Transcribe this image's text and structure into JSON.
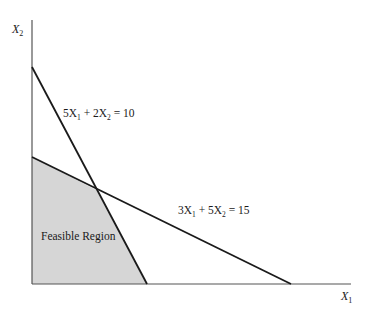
{
  "diagram": {
    "type": "linear-programming-feasible-region",
    "axes": {
      "x_label": "X",
      "x_sub": "1",
      "y_label": "X",
      "y_sub": "2"
    },
    "constraints": [
      {
        "id": "c1",
        "label_parts": {
          "a": "5X",
          "a_sub": "1",
          "op": " + 2X",
          "b_sub": "2",
          "rhs": " = 10"
        },
        "equation": "5X1 + 2X2 = 10",
        "x_intercept": 2,
        "y_intercept": 5
      },
      {
        "id": "c2",
        "label_parts": {
          "a": "3X",
          "a_sub": "1",
          "op": " + 5X",
          "b_sub": "2",
          "rhs": " = 15"
        },
        "equation": "3X1 + 5X2 = 15",
        "x_intercept": 5,
        "y_intercept": 3
      }
    ],
    "region_label": "Feasible Region",
    "colors": {
      "region_fill": "#d6d6d6",
      "line": "#1a1a1a",
      "axis": "#555555"
    }
  }
}
